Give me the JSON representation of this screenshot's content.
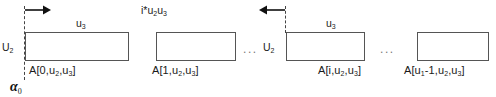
{
  "figure": {
    "type": "diagram",
    "background_color": "#ffffff",
    "box_border_color": "#555555",
    "dash_color": "#444444",
    "text_color": "#1a1a1a"
  },
  "annotations": {
    "top_left_dim": "u",
    "top_left_dim_sub": "3",
    "left_dim": "U",
    "left_dim_sub": "2",
    "offset_expr_prefix": "i*u",
    "offset_expr_sub1": "2",
    "offset_expr_mid": "u",
    "offset_expr_sub2": "3",
    "group3_top_dim": "u",
    "group3_top_dim_sub": "3",
    "group3_left_dim": "U",
    "group3_left_dim_sub": "2",
    "alpha_symbol": "α",
    "alpha_sub": "0",
    "ellipsis_1": "...",
    "ellipsis_2": "..."
  },
  "cells": [
    {
      "id": "cell-0",
      "label_prefix": "A[",
      "index": "0",
      "label_mid_a": ",u",
      "sub_a": "2",
      "label_mid_b": ",u",
      "sub_b": "3",
      "label_suffix": "]",
      "full_label": "A[0,u2,u3]"
    },
    {
      "id": "cell-1",
      "label_prefix": "A[",
      "index": "1",
      "label_mid_a": ",u",
      "sub_a": "2",
      "label_mid_b": ",u",
      "sub_b": "3",
      "label_suffix": "]",
      "full_label": "A[1,u2,u3]"
    },
    {
      "id": "cell-i",
      "label_prefix": "A[",
      "index": "i",
      "label_mid_a": ",u",
      "sub_a": "2",
      "label_mid_b": ",u",
      "sub_b": "3",
      "label_suffix": "]",
      "full_label": "A[i,u2,u3]"
    },
    {
      "id": "cell-last",
      "label_prefix": "A[u",
      "index_sub": "1",
      "index_rest": "-1",
      "label_mid_a": ",u",
      "sub_a": "2",
      "label_mid_b": ",u",
      "sub_b": "3",
      "label_suffix": "]",
      "full_label": "A[u1-1,u2,u3]"
    }
  ]
}
